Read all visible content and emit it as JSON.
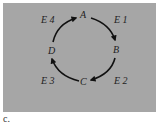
{
  "diagram": {
    "background_color": "#a6a6a6",
    "arrow_color": "#111111",
    "nodes": [
      {
        "id": "A",
        "label": "A"
      },
      {
        "id": "B",
        "label": "B"
      },
      {
        "id": "C",
        "label": "C"
      },
      {
        "id": "D",
        "label": "D"
      }
    ],
    "edges": [
      {
        "from": "A",
        "to": "B",
        "label": "E 1"
      },
      {
        "from": "B",
        "to": "C",
        "label": "E 2"
      },
      {
        "from": "C",
        "to": "D",
        "label": "E 3"
      },
      {
        "from": "D",
        "to": "A",
        "label": "E 4"
      }
    ],
    "layout": "cycle-clockwise"
  },
  "caption": "c."
}
